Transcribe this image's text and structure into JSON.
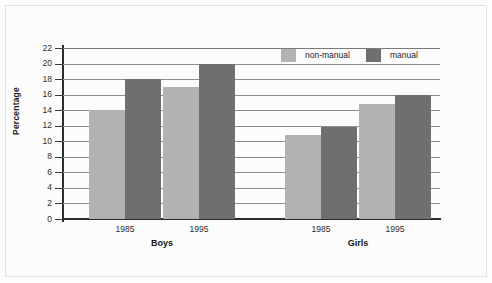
{
  "chart_data": {
    "type": "bar",
    "title": "",
    "xlabel": "",
    "ylabel": "Percentage",
    "ylim": [
      0,
      22
    ],
    "ytick_step": 2,
    "yticks": [
      "22",
      "20",
      "18",
      "16",
      "14",
      "12",
      "10",
      "8",
      "6",
      "4",
      "2",
      "0"
    ],
    "grid": true,
    "legend_position": "top-right",
    "groups": [
      {
        "name": "Boys",
        "categories": [
          "1985",
          "1995"
        ]
      },
      {
        "name": "Girls",
        "categories": [
          "1985",
          "1995"
        ]
      }
    ],
    "categories": [
      "Boys 1985",
      "Boys 1995",
      "Girls 1985",
      "Girls 1995"
    ],
    "series": [
      {
        "name": "non-manual",
        "color": "#b2b2b2",
        "values": [
          14,
          17,
          10.8,
          14.8
        ]
      },
      {
        "name": "manual",
        "color": "#6f6f6f",
        "values": [
          18,
          20,
          11.8,
          16
        ]
      }
    ]
  },
  "axis": {
    "y_title": "Percentage",
    "y_labels": [
      "22",
      "20",
      "18",
      "16",
      "14",
      "12",
      "10",
      "8",
      "6",
      "4",
      "2",
      "0"
    ]
  },
  "legend": {
    "items": [
      {
        "label": "non-manual",
        "color": "#b2b2b2"
      },
      {
        "label": "manual",
        "color": "#6f6f6f"
      }
    ]
  },
  "x_axis": {
    "ticks": [
      "1985",
      "1995",
      "1985",
      "1995"
    ],
    "groups": [
      "Boys",
      "Girls"
    ]
  },
  "colors": {
    "non_manual": "#b2b2b2",
    "manual": "#6f6f6f",
    "axis": "#2b2b2b",
    "grid": "#8e8e8e",
    "background": "#fdfdfd"
  }
}
